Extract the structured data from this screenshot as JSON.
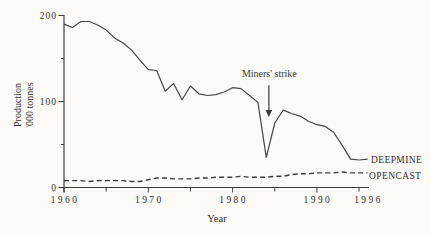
{
  "figure": {
    "background_color": "#fbfaf7",
    "ink_color": "#3e3e3e"
  },
  "chart_data": {
    "type": "line",
    "title": "",
    "xlabel": "Year",
    "ylabel": "Production '000 tonnes",
    "ylabel_line1": "Production",
    "ylabel_line2": "'000 tonnes",
    "xlim": [
      1960,
      1996
    ],
    "ylim": [
      0,
      200
    ],
    "grid": false,
    "legend_position": "right of line ends",
    "x_axis": {
      "major_ticks": [
        1960,
        1970,
        1980,
        1990
      ],
      "major_tick_labels": [
        "1960",
        "1970",
        "1980",
        "1990"
      ],
      "minor_ticks": [
        1965,
        1975,
        1985,
        1995
      ],
      "end_label": "1996"
    },
    "y_axis": {
      "major_ticks": [
        0,
        100,
        200
      ],
      "major_tick_labels": [
        "0",
        "100",
        "200"
      ],
      "minor_ticks": [
        50,
        150
      ]
    },
    "x": [
      1960,
      1961,
      1962,
      1963,
      1964,
      1965,
      1966,
      1967,
      1968,
      1969,
      1970,
      1971,
      1972,
      1973,
      1974,
      1975,
      1976,
      1977,
      1978,
      1979,
      1980,
      1981,
      1982,
      1983,
      1984,
      1985,
      1986,
      1987,
      1988,
      1989,
      1990,
      1991,
      1992,
      1993,
      1994,
      1995,
      1996
    ],
    "series": [
      {
        "name": "DEEPMINE",
        "style": "solid",
        "values": [
          190,
          186,
          193,
          193,
          189,
          183,
          174,
          168,
          160,
          148,
          137,
          136,
          112,
          121,
          102,
          118,
          109,
          107,
          108,
          111,
          116,
          115,
          107,
          99,
          35,
          75,
          90,
          86,
          83,
          77,
          73,
          71,
          64,
          49,
          33,
          32,
          33
        ]
      },
      {
        "name": "OPENCAST",
        "style": "dashed",
        "values": [
          8,
          8,
          8,
          7,
          8,
          8,
          8,
          8,
          7,
          7,
          9,
          11,
          11,
          10,
          10,
          10,
          11,
          11,
          12,
          12,
          12,
          13,
          12,
          12,
          12,
          13,
          13,
          15,
          16,
          16,
          17,
          17,
          17,
          18,
          17,
          17,
          17
        ]
      }
    ],
    "annotation": {
      "text": "Miners' strike",
      "x_year": 1984.3,
      "text_value": 129,
      "arrow_top_value": 119,
      "arrow_tip_value": 82
    }
  }
}
